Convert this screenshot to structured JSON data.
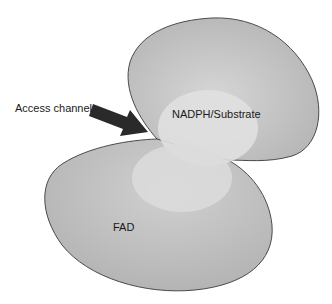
{
  "diagram": {
    "labels": {
      "access_channel": "Access channel",
      "nadph_substrate": "NADPH/Substrate",
      "fad": "FAD"
    },
    "colors": {
      "lobe_fill_outer": "#b8b8b8",
      "lobe_fill_inner": "#d2d2d2",
      "cavity_fill": "#e2e2e2",
      "outline": "#4a4a4a",
      "arrow": "#2a2a2a",
      "background": "#ffffff"
    }
  }
}
